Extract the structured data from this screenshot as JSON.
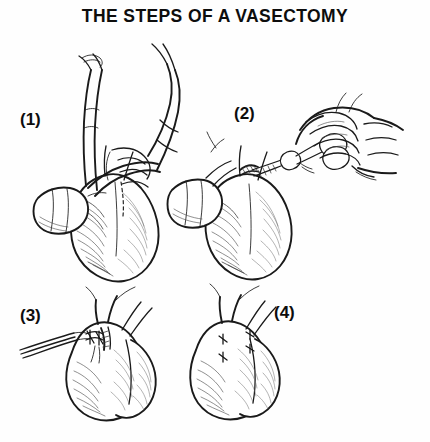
{
  "figure": {
    "title": "THE STEPS OF A VASECTOMY",
    "style": "black-and-white pen-and-ink medical line illustration with hatched shading",
    "layout": "two-by-two grid of four numbered panels beneath a centered bold title",
    "background_color": "#fefefe",
    "ink_color": "#1a1a1a",
    "shading_color": "#4a4a4a"
  },
  "panels": [
    {
      "number": "(1)",
      "label": "(1)",
      "label_position": "left of the drawing",
      "grid_position": "top-left",
      "depicts": "A hand grasping and steadying the scrotum from above while the thumb and fingers stabilize the skin; a dashed vertical line marks the planned incision site.",
      "elements": [
        "hand",
        "thumb",
        "fingers",
        "wrist",
        "scrotum",
        "dashed-incision-line"
      ]
    },
    {
      "number": "(2)",
      "label": "(2)",
      "label_position": "left of the drawing",
      "grid_position": "top-right",
      "depicts": "A hand entering from the right holds a hemostat/forceps whose tips reach the small incision in the scrotal skin while the other hand steadies the scrotum from the left.",
      "elements": [
        "hand",
        "forceps",
        "ring-handles",
        "forceps-tips",
        "incision",
        "scrotum"
      ]
    },
    {
      "number": "(3)",
      "label": "(3)",
      "label_position": "left of the drawing",
      "grid_position": "bottom-left",
      "depicts": "Fine forceps enter from the left to grasp the exposed vas deferens, which has been lifted through the incision and ligated at two points before being divided.",
      "elements": [
        "forceps-tips",
        "vas-deferens",
        "ligature-ties",
        "incision",
        "scrotum"
      ]
    },
    {
      "number": "(4)",
      "label": "(4)",
      "label_position": "right of the drawing",
      "grid_position": "bottom-right",
      "depicts": "The completed procedure: the scrotum with the small incision closed, showing two sets of short cross-shaped suture marks on the skin.",
      "elements": [
        "scrotum",
        "suture-marks",
        "closed-incision"
      ]
    }
  ]
}
